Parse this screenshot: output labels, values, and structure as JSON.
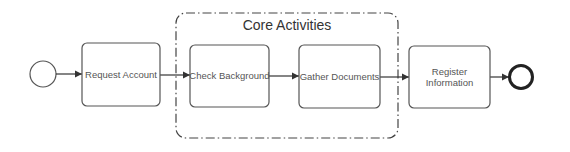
{
  "diagram": {
    "type": "bpmn-process",
    "colors": {
      "stroke": "#333333",
      "text": "#555555",
      "background": "#ffffff"
    },
    "start_event": {
      "label": ""
    },
    "end_event": {
      "label": ""
    },
    "group": {
      "label": "Core Activities"
    },
    "tasks": [
      {
        "id": "request",
        "lines": [
          "Request Account"
        ]
      },
      {
        "id": "check",
        "lines": [
          "Check Background"
        ]
      },
      {
        "id": "gather",
        "lines": [
          "Gather Documents"
        ]
      },
      {
        "id": "register",
        "lines": [
          "Register",
          "Information"
        ]
      }
    ],
    "flows": [
      {
        "from": "start",
        "to": "request"
      },
      {
        "from": "request",
        "to": "check"
      },
      {
        "from": "check",
        "to": "gather"
      },
      {
        "from": "gather",
        "to": "register"
      },
      {
        "from": "register",
        "to": "end"
      }
    ]
  }
}
